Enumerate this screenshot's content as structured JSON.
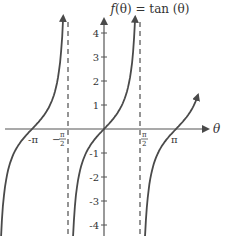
{
  "chart_data": {
    "type": "line",
    "xlabel": "θ",
    "ylabel": "",
    "function": "tan",
    "xlim": [
      -4.5,
      4.4
    ],
    "ylim": [
      -4.4,
      4.6
    ],
    "x_ticks": [
      {
        "value": -3.14159,
        "label": "-π"
      },
      {
        "value": -1.5708,
        "label": "−π/2"
      },
      {
        "value": 1.5708,
        "label": "π/2"
      },
      {
        "value": 3.14159,
        "label": "π"
      }
    ],
    "y_ticks": [
      {
        "value": 4,
        "label": "4"
      },
      {
        "value": 3,
        "label": "3"
      },
      {
        "value": 2,
        "label": "2"
      },
      {
        "value": 1,
        "label": "1"
      },
      {
        "value": -1,
        "label": "-1"
      },
      {
        "value": -2,
        "label": "-2"
      },
      {
        "value": -3,
        "label": "-3"
      },
      {
        "value": -4,
        "label": "-4"
      }
    ],
    "asymptotes": [
      -1.5708,
      1.5708
    ],
    "branches": [
      {
        "from": -4.5,
        "to": -1.78,
        "note": "left branch through (-π, 0)"
      },
      {
        "from": -1.36,
        "to": 1.36,
        "note": "central branch through origin"
      },
      {
        "from": 1.79,
        "to": 4.1,
        "note": "right branch through (π, 0)"
      }
    ],
    "grid": false,
    "legend": null
  },
  "labels": {
    "title_f": "f",
    "title_rest": "(θ) = tan (θ)",
    "x_axis": "θ",
    "neg_pi": "-π",
    "pi": "π",
    "pi_sym": "π",
    "half_den": "2",
    "minus": "−",
    "y4": "4",
    "y3": "3",
    "y2": "2",
    "y1": "1",
    "ym1": "-1",
    "ym2": "-2",
    "ym3": "-3",
    "ym4": "-4"
  },
  "colors": {
    "curve": "#4a4a4a",
    "axis": "#555555",
    "asymptote": "#7a7a7a",
    "text": "#333333"
  }
}
